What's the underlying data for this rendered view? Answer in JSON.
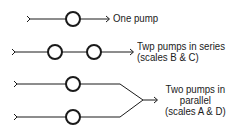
{
  "diagram": {
    "configurations": [
      {
        "id": "one-pump",
        "label_lines": [
          "One pump"
        ]
      },
      {
        "id": "series",
        "label_lines": [
          "Twp pumps in series",
          "(scales B & C)"
        ]
      },
      {
        "id": "parallel",
        "label_lines": [
          "Two pumps in",
          "parallel",
          "(scales A & D)"
        ]
      }
    ],
    "stroke_color": "#1a1a1a"
  }
}
